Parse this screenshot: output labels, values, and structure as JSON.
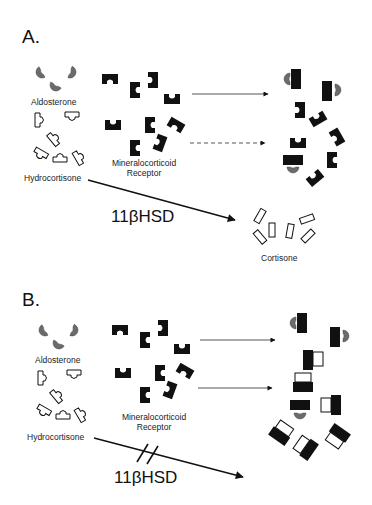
{
  "figure": {
    "panels": [
      {
        "id": "A",
        "label": "A.",
        "ligands": {
          "aldosterone_label": "Aldosterone",
          "hydrocortisone_label": "Hydrocortisone"
        },
        "receptor_label_line1": "Mineralocorticoid",
        "receptor_label_line2": "Receptor",
        "enzyme_label": "11βHSD",
        "product_label": "Cortisone",
        "arrows": [
          {
            "style": "solid",
            "meaning": "aldosterone binding"
          },
          {
            "style": "dashed",
            "meaning": "hydrocortisone weak binding"
          },
          {
            "style": "solid-bold",
            "meaning": "hydrocortisone converted to cortisone by 11βHSD"
          }
        ]
      },
      {
        "id": "B",
        "label": "B.",
        "ligands": {
          "aldosterone_label": "Aldosterone",
          "hydrocortisone_label": "Hydrocortisone"
        },
        "receptor_label_line1": "Mineralocorticoid",
        "receptor_label_line2": "Receptor",
        "enzyme_label": "11βHSD",
        "arrows": [
          {
            "style": "solid",
            "meaning": "aldosterone binding"
          },
          {
            "style": "solid",
            "meaning": "hydrocortisone binding"
          },
          {
            "style": "solid-bold-blocked",
            "meaning": "11βHSD pathway blocked"
          }
        ]
      }
    ],
    "colors": {
      "receptor": "#111111",
      "aldosterone": "#6b6b6b",
      "outline": "#111111",
      "background": "#ffffff"
    }
  }
}
